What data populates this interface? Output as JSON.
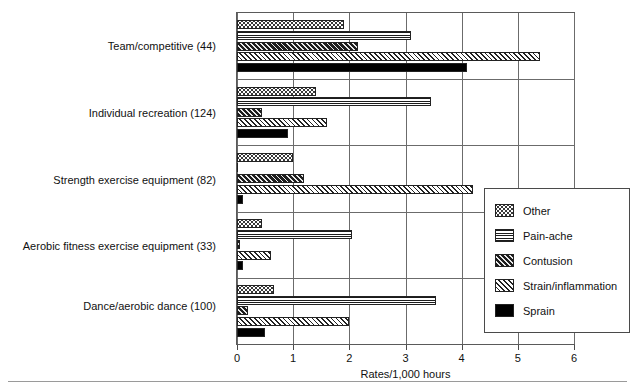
{
  "chart_data": {
    "type": "bar",
    "orientation": "horizontal",
    "title": "",
    "xlabel": "Rates/1,000 hours",
    "ylabel": "",
    "xlim": [
      0,
      6
    ],
    "xticks": [
      "0",
      "1",
      "2",
      "3",
      "4",
      "5",
      "6"
    ],
    "grid": true,
    "legend_position": "right-inside",
    "categories": [
      "Team/competitive (44)",
      "Individual recreation (124)",
      "Strength exercise equipment (82)",
      "Aerobic fitness exercise equipment (33)",
      "Dance/aerobic dance (100)"
    ],
    "series": [
      {
        "name": "Other",
        "pattern": "dotted",
        "values": [
          1.9,
          1.4,
          1.0,
          0.45,
          0.65
        ]
      },
      {
        "name": "Pain-ache",
        "pattern": "horizontal",
        "values": [
          3.1,
          3.45,
          0.0,
          2.05,
          3.55
        ]
      },
      {
        "name": "Contusion",
        "pattern": "dark-diagonal",
        "values": [
          2.15,
          0.45,
          1.2,
          0.05,
          0.2
        ]
      },
      {
        "name": "Strain/inflammation",
        "pattern": "light-diagonal",
        "values": [
          5.4,
          1.6,
          4.2,
          0.6,
          2.0
        ]
      },
      {
        "name": "Sprain",
        "pattern": "solid-black",
        "values": [
          4.1,
          0.9,
          0.1,
          0.1,
          0.5
        ]
      }
    ]
  },
  "legend": {
    "items": [
      {
        "label": "Other"
      },
      {
        "label": "Pain-ache"
      },
      {
        "label": "Contusion"
      },
      {
        "label": "Strain/inflammation"
      },
      {
        "label": "Sprain"
      }
    ]
  },
  "axis": {
    "x_title": "Rates/1,000 hours",
    "ticks": [
      "0",
      "1",
      "2",
      "3",
      "4",
      "5",
      "6"
    ]
  }
}
